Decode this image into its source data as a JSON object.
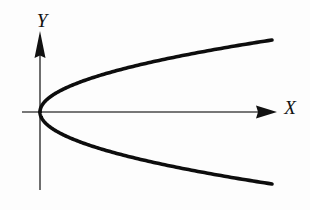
{
  "figure": {
    "background_color": "#fdfdfd",
    "axis_color": "#4a4a4a",
    "curve_color": "#0d0d0d",
    "label_color": "#111111"
  },
  "axes": {
    "x_axis": {
      "label": "X",
      "label_x": 290,
      "label_y": 114,
      "line_start_x": 22,
      "line_end_x": 266,
      "line_y": 112,
      "arrow_tip_x": 277,
      "arrow_name": "x-axis-arrowhead"
    },
    "y_axis": {
      "label": "Y",
      "label_x": 42,
      "label_y": 27,
      "line_x": 40,
      "line_start_y": 190,
      "line_end_y": 48,
      "arrow_tip_y": 31,
      "arrow_name": "y-axis-arrowhead"
    },
    "origin": {
      "x": 40,
      "y": 112
    }
  },
  "chart_data": {
    "type": "line",
    "title": "",
    "xlabel": "X",
    "ylabel": "Y",
    "grid": false,
    "legend": null,
    "curve_name": "parabola",
    "equation": "y^2 = 4px  (opens to the right, vertex at origin)",
    "vertex": {
      "x": 40,
      "y": 112
    },
    "opens": "right",
    "stroke_width": 3.6,
    "series": [
      {
        "name": "upper-branch",
        "points": [
          [
            40,
            112
          ],
          [
            41,
            104
          ],
          [
            43,
            97
          ],
          [
            47,
            90
          ],
          [
            53,
            83
          ],
          [
            62,
            76
          ],
          [
            74,
            69
          ],
          [
            89,
            63
          ],
          [
            107,
            57
          ],
          [
            128,
            52
          ],
          [
            152,
            48
          ],
          [
            178,
            45
          ],
          [
            205,
            43
          ],
          [
            232,
            41
          ],
          [
            258,
            40
          ],
          [
            272,
            40
          ]
        ]
      },
      {
        "name": "lower-branch",
        "points": [
          [
            40,
            112
          ],
          [
            41,
            121
          ],
          [
            43,
            129
          ],
          [
            47,
            137
          ],
          [
            54,
            145
          ],
          [
            64,
            152
          ],
          [
            77,
            158
          ],
          [
            93,
            164
          ],
          [
            112,
            169
          ],
          [
            134,
            173
          ],
          [
            158,
            177
          ],
          [
            184,
            180
          ],
          [
            211,
            182
          ],
          [
            238,
            183
          ],
          [
            262,
            184
          ],
          [
            272,
            184
          ]
        ]
      }
    ]
  }
}
